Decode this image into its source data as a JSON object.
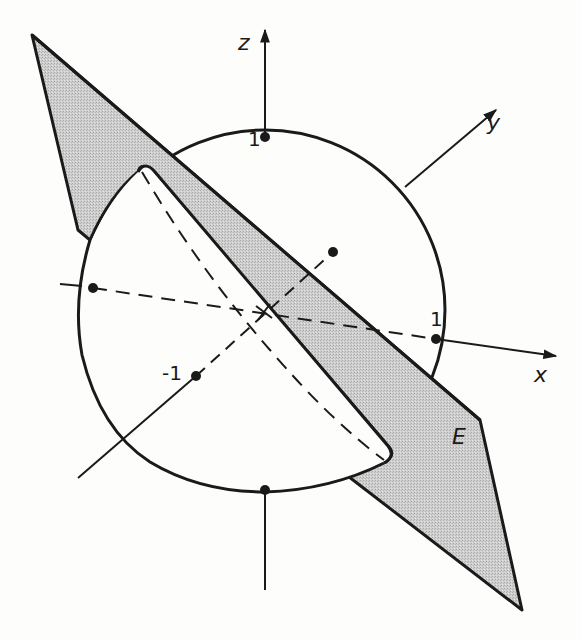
{
  "figure": {
    "type": "3d-sphere-plane-intersection",
    "colors": {
      "ink": "#1a1a1a",
      "plane_fill": "#c8c8c8",
      "background": "#fdfdfb"
    }
  },
  "axes": {
    "x": {
      "label": "x",
      "tick_label": "1"
    },
    "y": {
      "label": "y",
      "tick_label": "-1"
    },
    "z": {
      "label": "z",
      "tick_label": "1"
    }
  },
  "plane": {
    "label": "E"
  },
  "points": [
    {
      "name": "z-positive",
      "label": "1"
    },
    {
      "name": "z-negative",
      "label": ""
    },
    {
      "name": "x-positive",
      "label": "1"
    },
    {
      "name": "x-negative",
      "label": ""
    },
    {
      "name": "y-positive",
      "label": ""
    },
    {
      "name": "y-negative",
      "label": "-1"
    }
  ]
}
